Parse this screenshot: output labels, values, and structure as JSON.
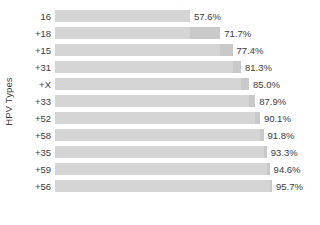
{
  "chart_data": {
    "type": "bar",
    "orientation": "horizontal",
    "title": "",
    "xlabel": "",
    "ylabel": "HPV Types",
    "categories": [
      "16",
      "+18",
      "+15",
      "+31",
      "+X",
      "+33",
      "+52",
      "+58",
      "+35",
      "+59",
      "+56"
    ],
    "values": [
      57.6,
      71.7,
      77.4,
      81.3,
      85.0,
      87.9,
      90.1,
      91.8,
      93.3,
      94.6,
      95.7
    ],
    "value_labels": [
      "57.6%",
      "71.7%",
      "77.4%",
      "81.3%",
      "85.0%",
      "87.9%",
      "90.1%",
      "91.8%",
      "93.3%",
      "94.6%",
      "95.7%"
    ],
    "increments": [
      57.6,
      14.1,
      5.7,
      3.9,
      3.7,
      2.9,
      2.2,
      1.7,
      1.5,
      1.3,
      1.1
    ],
    "xlim": [
      0,
      100
    ],
    "grid": false,
    "legend": null,
    "bar_color": "#d5d5d5",
    "increment_color": "#c9c9c9",
    "text_color": "#3b3b3b",
    "background": "#ffffff"
  },
  "axis": {
    "y_title": "HPV Types"
  },
  "artifact": {
    "title_remnant": "......"
  }
}
